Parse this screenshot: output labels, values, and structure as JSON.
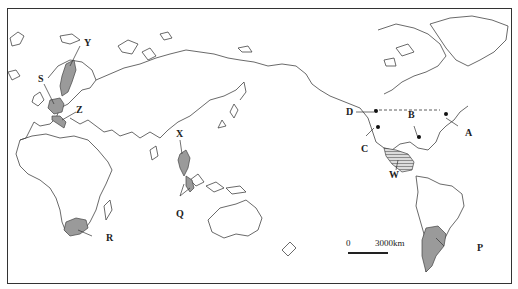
{
  "map": {
    "type": "world outline map, Pacific-centered",
    "labels": {
      "S": "S",
      "Y": "Y",
      "Z": "Z",
      "X": "X",
      "Q": "Q",
      "R": "R",
      "D": "D",
      "C": "C",
      "B": "B",
      "A": "A",
      "W": "W",
      "P": "P"
    },
    "shaded_regions": [
      {
        "label": "Y",
        "region": "Scandinavia (Sweden)"
      },
      {
        "label": "S",
        "region": "France"
      },
      {
        "label": "Z",
        "region": "Italy"
      },
      {
        "label": "X",
        "region": "Southeast Asia (Thailand/Vietnam)"
      },
      {
        "label": "Q",
        "region": "Malay Peninsula / Indonesia"
      },
      {
        "label": "R",
        "region": "South Africa"
      },
      {
        "label": "W",
        "region": "Mexico (hatched)"
      },
      {
        "label": "P",
        "region": "Argentina"
      }
    ],
    "points": [
      {
        "label": "D",
        "desc": "west coast of North America"
      },
      {
        "label": "C",
        "desc": "California coast"
      },
      {
        "label": "B",
        "desc": "Gulf of Mexico coast"
      },
      {
        "label": "A",
        "desc": "northeast US coast"
      }
    ],
    "scale": {
      "zero": "0",
      "distance": "3000km"
    }
  }
}
